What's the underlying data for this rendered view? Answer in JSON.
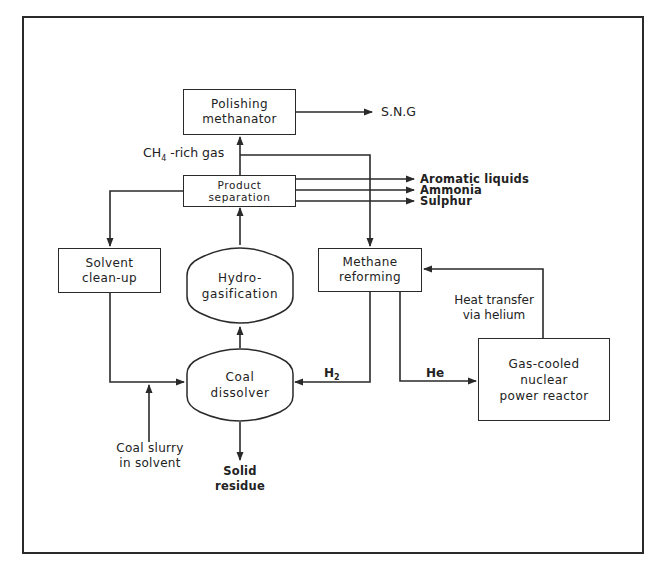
{
  "diagram": {
    "type": "process-flow",
    "units": {
      "polishing_methanator": {
        "line1": "Polishing",
        "line2": "methanator"
      },
      "product_separation": {
        "line1": "Product",
        "line2": "separation"
      },
      "solvent_cleanup": {
        "line1": "Solvent",
        "line2": "clean-up"
      },
      "hydrogasification": {
        "line1": "Hydro-",
        "line2": "gasification"
      },
      "methane_reforming": {
        "line1": "Methane",
        "line2": "reforming"
      },
      "coal_dissolver": {
        "line1": "Coal",
        "line2": "dissolver"
      },
      "nuclear_reactor": {
        "line1": "Gas-cooled",
        "line2": "nuclear",
        "line3": "power reactor"
      }
    },
    "streams": {
      "sng": "S.N.G",
      "ch4_rich_gas_prefix": "CH",
      "ch4_rich_gas_sub": "4",
      "ch4_rich_gas_suffix": " -rich gas",
      "aromatic_liquids": "Aromatic liquids",
      "ammonia": "Ammonia",
      "sulphur": "Sulphur",
      "h2_prefix": "H",
      "h2_sub": "2",
      "he": "He",
      "heat_transfer_line1": "Heat transfer",
      "heat_transfer_line2": "via helium",
      "coal_slurry_line1": "Coal slurry",
      "coal_slurry_line2": "in solvent",
      "solid_residue_line1": "Solid",
      "solid_residue_line2": "residue"
    },
    "colors": {
      "line": "#2a2a2a",
      "background": "#ffffff"
    }
  }
}
